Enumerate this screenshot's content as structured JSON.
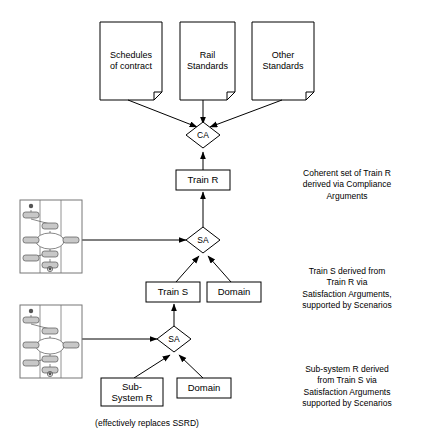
{
  "diagram": {
    "documents": [
      {
        "label": "Schedules\nof contract",
        "x": 100,
        "y": 22,
        "w": 62,
        "h": 78
      },
      {
        "label": "Rail\nStandards",
        "x": 180,
        "y": 22,
        "w": 55,
        "h": 78
      },
      {
        "label": "Other\nStandards",
        "x": 252,
        "y": 22,
        "w": 62,
        "h": 78
      }
    ],
    "diamonds": [
      {
        "label": "CA",
        "cx": 203,
        "cy": 135,
        "rx": 17,
        "ry": 13
      },
      {
        "label": "SA",
        "cx": 203,
        "cy": 240,
        "rx": 17,
        "ry": 13
      },
      {
        "label": "SA",
        "cx": 174,
        "cy": 339,
        "rx": 17,
        "ry": 13
      }
    ],
    "boxes": [
      {
        "label": "Train R",
        "x": 176,
        "y": 170,
        "w": 54,
        "h": 20
      },
      {
        "label": "Train S",
        "x": 146,
        "y": 282,
        "w": 54,
        "h": 20
      },
      {
        "label": "Domain",
        "x": 207,
        "y": 282,
        "w": 54,
        "h": 20
      },
      {
        "label": "Sub-\nSystem R",
        "x": 101,
        "y": 378,
        "w": 62,
        "h": 28
      },
      {
        "label": "Domain",
        "x": 177,
        "y": 378,
        "w": 54,
        "h": 20
      }
    ],
    "scenario_panels": [
      {
        "name": "scenario-thumbnail-upper",
        "x": 20,
        "y": 200,
        "w": 62,
        "h": 73
      },
      {
        "name": "scenario-thumbnail-lower",
        "x": 20,
        "y": 305,
        "w": 62,
        "h": 73
      }
    ],
    "annotations": [
      {
        "name": "annotation-compliance",
        "text": "Coherent set of Train R\nderived via Compliance\nArguments",
        "x": 277,
        "y": 168,
        "w": 140
      },
      {
        "name": "annotation-train-s",
        "text": "Train S derived from\nTrain R via\nSatisfaction Arguments,\nsupported by Scenarios",
        "x": 277,
        "y": 266,
        "w": 140
      },
      {
        "name": "annotation-sub-system",
        "text": "Sub-system R derived\nfrom Train S via\nSatisfaction Arguments\nsupported by Scenarios",
        "x": 277,
        "y": 364,
        "w": 140
      }
    ],
    "caption": {
      "text": "(effectively replaces SSRD)",
      "x": 62,
      "y": 418,
      "w": 170
    }
  },
  "colors": {
    "stroke": "#000000",
    "background": "#ffffff",
    "thumbnail_fill": "#c8c8c8",
    "thumbnail_stroke": "#555555"
  }
}
